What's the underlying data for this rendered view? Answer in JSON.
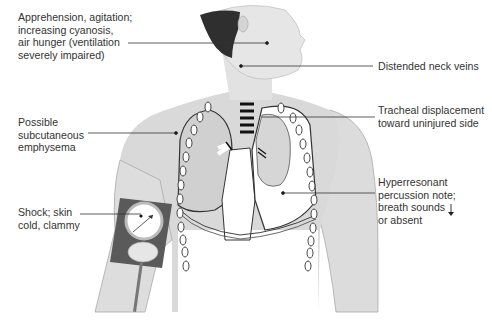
{
  "figure": {
    "colors": {
      "background": "#ffffff",
      "skin": "#d9d9d9",
      "skin_light": "#e8e8e8",
      "hair": "#2f2f2f",
      "lung_injured": "#ffffff",
      "lung_normal": "#cfcfcf",
      "outline": "#444444",
      "cuff": "#5a5a5a",
      "text": "#333333"
    },
    "labels": [
      {
        "id": "apprehension",
        "text": "Apprehension, agitation;\nincreasing cyanosis,\nair hunger (ventilation\nseverely impaired)",
        "side": "left"
      },
      {
        "id": "neck-veins",
        "text": "Distended neck veins",
        "side": "right"
      },
      {
        "id": "subcutaneous",
        "text": "Possible\nsubcutaneous\nemphysema",
        "side": "left"
      },
      {
        "id": "tracheal",
        "text": "Tracheal displacement\ntoward uninjured side",
        "side": "right"
      },
      {
        "id": "hyperresonant",
        "text": "Hyperresonant\npercussion note;\nbreath sounds\nor absent",
        "side": "right",
        "icon": "down-arrow-icon"
      },
      {
        "id": "shock",
        "text": "Shock; skin\ncold, clammy",
        "side": "left"
      }
    ]
  }
}
